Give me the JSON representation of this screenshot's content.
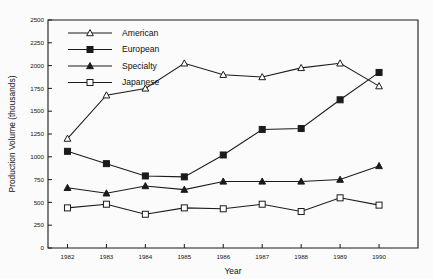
{
  "chart_data": {
    "type": "line",
    "title": "",
    "xlabel": "Year",
    "ylabel": "Production Volume (thousands)",
    "x": [
      1982,
      1983,
      1984,
      1985,
      1986,
      1987,
      1988,
      1989,
      1990
    ],
    "xtick_labels": [
      "1982",
      "1983",
      "1984",
      "1985",
      "1986",
      "1987",
      "1988",
      "1989",
      "1990"
    ],
    "ytick_labels": [
      "0",
      "250",
      "500",
      "750",
      "1000",
      "1250",
      "1500",
      "1750",
      "2000",
      "2250",
      "2500"
    ],
    "yticks": [
      0,
      250,
      500,
      750,
      1000,
      1250,
      1500,
      1750,
      2000,
      2250,
      2500
    ],
    "ylim": [
      0,
      2500
    ],
    "xlim": [
      1981.5,
      1991.0
    ],
    "grid": false,
    "legend_position": "top-left-inside",
    "series": [
      {
        "name": "American",
        "marker": "triangle-open",
        "values": [
          1200,
          1675,
          1750,
          2025,
          1900,
          1875,
          1975,
          2025,
          1775
        ]
      },
      {
        "name": "European",
        "marker": "square-filled",
        "values": [
          1060,
          925,
          790,
          780,
          1020,
          1300,
          1310,
          1625,
          1925
        ]
      },
      {
        "name": "Specialty",
        "marker": "triangle-filled",
        "values": [
          660,
          600,
          680,
          640,
          730,
          730,
          730,
          750,
          900
        ]
      },
      {
        "name": "Japanese",
        "marker": "square-open",
        "values": [
          440,
          480,
          370,
          440,
          430,
          480,
          400,
          550,
          470
        ]
      }
    ]
  }
}
